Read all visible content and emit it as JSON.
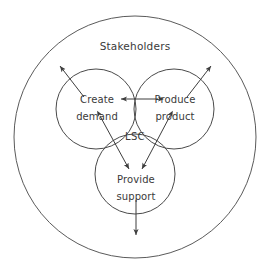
{
  "diagram": {
    "type": "venn-three-circle-with-container",
    "canvas": {
      "width": 267,
      "height": 277,
      "background": "#ffffff"
    },
    "stroke_color": "#4a4a4a",
    "text_color": "#3a3a3a",
    "outer": {
      "label": "Stakeholders",
      "label_x": 135,
      "label_y": 47,
      "cx": 135,
      "cy": 137,
      "r": 121
    },
    "center": {
      "label": "LSC",
      "label_x": 135,
      "label_y": 137
    },
    "circles": [
      {
        "name": "create-demand",
        "label_line1": "Create",
        "label_line2": "demand",
        "cx": 96,
        "cy": 109,
        "r": 40,
        "label_x": 97,
        "label_y1": 100,
        "label_y2": 117
      },
      {
        "name": "produce-product",
        "label_line1": "Produce",
        "label_line2": "product",
        "cx": 174,
        "cy": 109,
        "r": 40,
        "label_x": 175,
        "label_y1": 100,
        "label_y2": 117
      },
      {
        "name": "provide-support",
        "label_line1": "Provide",
        "label_line2": "support",
        "cx": 135,
        "cy": 174,
        "r": 40,
        "label_x": 136,
        "label_y1": 180,
        "label_y2": 197
      }
    ],
    "connector_arrows": [
      {
        "name": "create-demand-to-produce-product",
        "from": "create-demand",
        "to": "produce-product",
        "x1": 158,
        "y1": 99,
        "x2": 121,
        "y2": 99,
        "bidirectional": true
      },
      {
        "name": "create-demand-to-provide-support",
        "from": "create-demand",
        "to": "provide-support",
        "x1": 100,
        "y1": 116,
        "x2": 129,
        "y2": 169,
        "bidirectional": true
      },
      {
        "name": "produce-product-to-provide-support",
        "from": "produce-product",
        "to": "provide-support",
        "x1": 170,
        "y1": 116,
        "x2": 142,
        "y2": 169,
        "bidirectional": true
      }
    ],
    "outward_arrows": [
      {
        "name": "create-demand-outward",
        "from": "create-demand",
        "x1": 84,
        "y1": 97,
        "x2": 60,
        "y2": 66,
        "bidirectional": false
      },
      {
        "name": "produce-product-outward",
        "from": "produce-product",
        "x1": 187,
        "y1": 97,
        "x2": 211,
        "y2": 66,
        "bidirectional": false
      },
      {
        "name": "provide-support-outward",
        "from": "provide-support",
        "x1": 136,
        "y1": 200,
        "x2": 136,
        "y2": 235,
        "bidirectional": false
      }
    ]
  }
}
